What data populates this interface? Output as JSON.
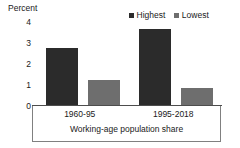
{
  "chart_data": {
    "type": "bar",
    "title": "",
    "xlabel": "Working-age population share",
    "ylabel": "Percent",
    "categories": [
      "1960-95",
      "1995-2018"
    ],
    "series": [
      {
        "name": "Highest",
        "values": [
          2.7,
          3.6
        ],
        "color": "#2b2b2b"
      },
      {
        "name": "Lowest",
        "values": [
          1.2,
          0.8
        ],
        "color": "#6e6e6e"
      }
    ],
    "ylim": [
      0,
      4
    ],
    "yticks": [
      "4",
      "3",
      "2",
      "1",
      "0"
    ],
    "ytick_values": [
      4,
      3,
      2,
      1,
      0
    ],
    "grid": false,
    "legend_position": "top-right"
  },
  "axes": {
    "y_title": "Percent",
    "x_title": "Working-age population share"
  },
  "legend": {
    "entries": [
      {
        "label": "Highest",
        "color": "#2b2b2b"
      },
      {
        "label": "Lowest",
        "color": "#6e6e6e"
      }
    ]
  }
}
